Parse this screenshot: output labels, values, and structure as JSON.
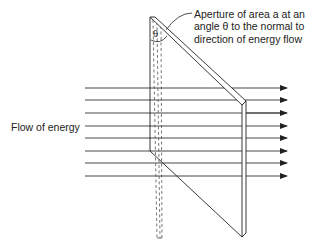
{
  "diagram": {
    "flow_label": "Flow of energy",
    "annotation": {
      "line1": "Aperture of area a at an",
      "line2": "angle θ to the normal to",
      "line3": "direction of energy flow"
    },
    "angle_symbol": "θ",
    "arrow_count": 8,
    "colors": {
      "line": "#222222",
      "dashed": "#555555",
      "background": "#ffffff"
    }
  }
}
